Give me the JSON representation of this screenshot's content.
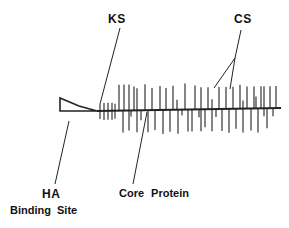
{
  "diagram": {
    "colors": {
      "line": "#222222",
      "background": "#ffffff",
      "text": "#111111"
    },
    "labels": {
      "ks": "KS",
      "cs": "CS",
      "ha": "HA",
      "binding_site": "Binding Site",
      "core_protein": "Core Protein"
    },
    "backbone": {
      "x1": 97,
      "y1": 111,
      "x2": 281,
      "y2": 108
    },
    "ha_binding_site_shape": "wedge",
    "ks_chains": [
      {
        "x": 100,
        "up": 7,
        "down": 8
      },
      {
        "x": 104,
        "up": 8,
        "down": 9
      },
      {
        "x": 108,
        "up": 8,
        "down": 9
      },
      {
        "x": 112,
        "up": 8,
        "down": 9
      },
      {
        "x": 115,
        "up": 7,
        "down": 8
      }
    ],
    "cs_chains": [
      {
        "x": 119,
        "up": 26,
        "down": 0
      },
      {
        "x": 123,
        "up": 0,
        "down": 22
      },
      {
        "x": 124,
        "up": 26,
        "down": 0
      },
      {
        "x": 129,
        "up": 26,
        "down": 20
      },
      {
        "x": 131,
        "up": 0,
        "down": 6
      },
      {
        "x": 134,
        "up": 24,
        "down": 0
      },
      {
        "x": 137,
        "up": 22,
        "down": 22
      },
      {
        "x": 141,
        "up": 0,
        "down": 10
      },
      {
        "x": 145,
        "up": 26,
        "down": 0
      },
      {
        "x": 148,
        "up": 0,
        "down": 22
      },
      {
        "x": 152,
        "up": 22,
        "down": 0
      },
      {
        "x": 155,
        "up": 0,
        "down": 20
      },
      {
        "x": 160,
        "up": 24,
        "down": 0
      },
      {
        "x": 163,
        "up": 0,
        "down": 24
      },
      {
        "x": 166,
        "up": 22,
        "down": 0
      },
      {
        "x": 170,
        "up": 0,
        "down": 22
      },
      {
        "x": 173,
        "up": 24,
        "down": 0
      },
      {
        "x": 177,
        "up": 10,
        "down": 0
      },
      {
        "x": 178,
        "up": 0,
        "down": 24
      },
      {
        "x": 182,
        "up": 0,
        "down": 6
      },
      {
        "x": 185,
        "up": 26,
        "down": 0
      },
      {
        "x": 188,
        "up": 0,
        "down": 22
      },
      {
        "x": 192,
        "up": 0,
        "down": 22
      },
      {
        "x": 195,
        "up": 24,
        "down": 0
      },
      {
        "x": 199,
        "up": 0,
        "down": 8
      },
      {
        "x": 201,
        "up": 22,
        "down": 22
      },
      {
        "x": 205,
        "up": 0,
        "down": 18
      },
      {
        "x": 208,
        "up": 22,
        "down": 0
      },
      {
        "x": 212,
        "up": 10,
        "down": 22
      },
      {
        "x": 216,
        "up": 0,
        "down": 8
      },
      {
        "x": 219,
        "up": 22,
        "down": 0
      },
      {
        "x": 222,
        "up": 0,
        "down": 22
      },
      {
        "x": 226,
        "up": 22,
        "down": 0
      },
      {
        "x": 229,
        "up": 0,
        "down": 24
      },
      {
        "x": 233,
        "up": 22,
        "down": 0
      },
      {
        "x": 236,
        "up": 0,
        "down": 20
      },
      {
        "x": 240,
        "up": 24,
        "down": 0
      },
      {
        "x": 243,
        "up": 8,
        "down": 24
      },
      {
        "x": 247,
        "up": 22,
        "down": 0
      },
      {
        "x": 251,
        "up": 0,
        "down": 22
      },
      {
        "x": 254,
        "up": 22,
        "down": 0
      },
      {
        "x": 256,
        "up": 12,
        "down": 0
      },
      {
        "x": 258,
        "up": 0,
        "down": 24
      },
      {
        "x": 261,
        "up": 22,
        "down": 0
      },
      {
        "x": 264,
        "up": 22,
        "down": 8
      },
      {
        "x": 267,
        "up": 0,
        "down": 20
      },
      {
        "x": 270,
        "up": 22,
        "down": 0
      },
      {
        "x": 273,
        "up": 0,
        "down": 8
      },
      {
        "x": 276,
        "up": 22,
        "down": 0
      }
    ],
    "leaders": {
      "ks": {
        "x1": 120,
        "y1": 28,
        "x2": 100,
        "y2": 104
      },
      "cs_a": {
        "x1": 241,
        "y1": 30,
        "x2": 235,
        "y2": 58
      },
      "cs_b": {
        "x1": 235,
        "y1": 58,
        "x2": 214,
        "y2": 88
      },
      "cs_c": {
        "x1": 235,
        "y1": 58,
        "x2": 230,
        "y2": 89
      },
      "ha": {
        "x1": 69,
        "y1": 121,
        "x2": 55,
        "y2": 184
      },
      "core": {
        "x1": 147,
        "y1": 112,
        "x2": 133,
        "y2": 184
      }
    }
  }
}
